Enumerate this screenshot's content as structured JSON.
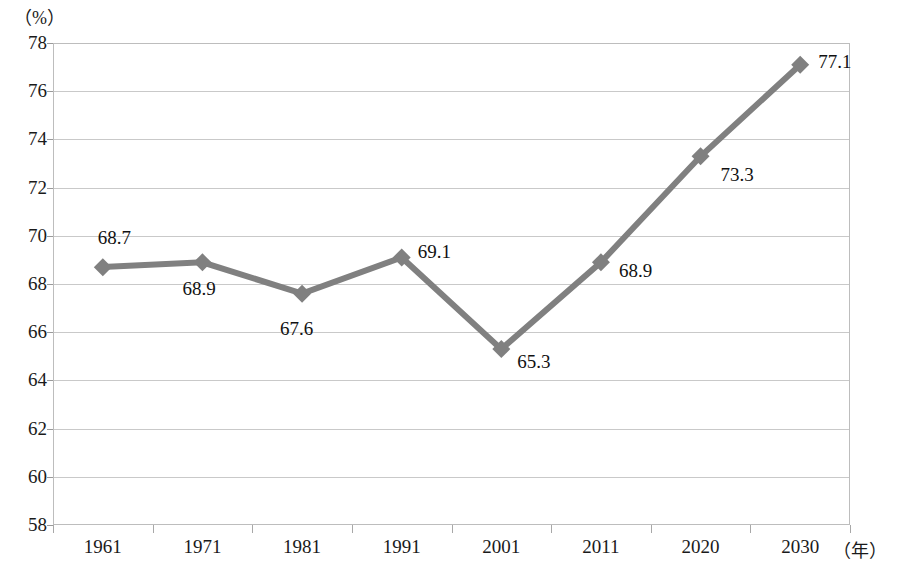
{
  "chart_data": {
    "type": "line",
    "title": "",
    "subtitle": "",
    "xlabel": "（年）",
    "ylabel": "（%）",
    "categories": [
      "1961",
      "1971",
      "1981",
      "1991",
      "2001",
      "2011",
      "2020",
      "2030"
    ],
    "values": [
      68.7,
      68.9,
      67.6,
      69.1,
      65.3,
      68.9,
      73.3,
      77.1
    ],
    "series": [
      {
        "name": "",
        "values": [
          68.7,
          68.9,
          67.6,
          69.1,
          65.3,
          68.9,
          73.3,
          77.1
        ]
      }
    ],
    "data_labels": [
      "68.7",
      "68.9",
      "67.6",
      "69.1",
      "65.3",
      "68.9",
      "73.3",
      "77.1"
    ],
    "ylim": [
      58,
      78
    ],
    "ytick_step": 2,
    "yticks": [
      "78",
      "76",
      "74",
      "72",
      "70",
      "68",
      "66",
      "64",
      "62",
      "60",
      "58"
    ],
    "grid": true,
    "grid_axis": "y",
    "legend": "none",
    "line_color": "#808080",
    "marker": "diamond",
    "marker_color": "#808080",
    "grid_color": "#c9c9c9",
    "axis_color": "#bdbdbd",
    "text_color": "#1a1a1a"
  },
  "axes": {
    "y_unit": "（%）",
    "x_unit": "（年）"
  }
}
